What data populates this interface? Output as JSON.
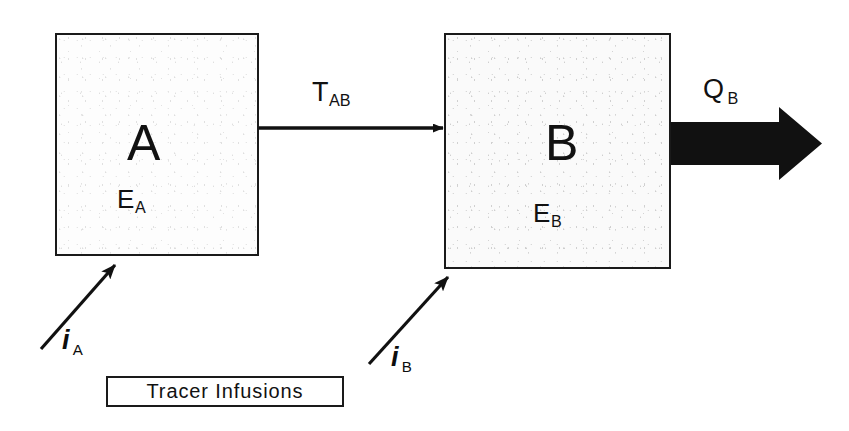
{
  "diagram": {
    "background_color": "#ffffff",
    "ink_color": "#111111",
    "compartments": [
      {
        "id": "A",
        "label": "A",
        "content_label": "E",
        "content_subscript": "A",
        "fill_color": "#fdfdfd",
        "border_color": "#1a1a1a"
      },
      {
        "id": "B",
        "label": "B",
        "content_label": "E",
        "content_subscript": "B",
        "fill_color": "#fafafa",
        "border_color": "#1a1a1a"
      }
    ],
    "flows": [
      {
        "id": "T_AB",
        "label": "T",
        "subscript": "AB",
        "style": "thin-arrow",
        "from": "A",
        "to": "B"
      },
      {
        "id": "Q_B",
        "label": "Q",
        "subscript": "B",
        "style": "thick-arrow",
        "from": "B",
        "to": "outflow"
      }
    ],
    "inputs": [
      {
        "id": "i_A",
        "label": "i",
        "subscript": "A",
        "style": "diagonal-arrow",
        "to": "A"
      },
      {
        "id": "i_B",
        "label": "i",
        "subscript": "B",
        "style": "diagonal-arrow",
        "to": "B"
      }
    ],
    "caption_box": {
      "text": "Tracer Infusions"
    }
  }
}
